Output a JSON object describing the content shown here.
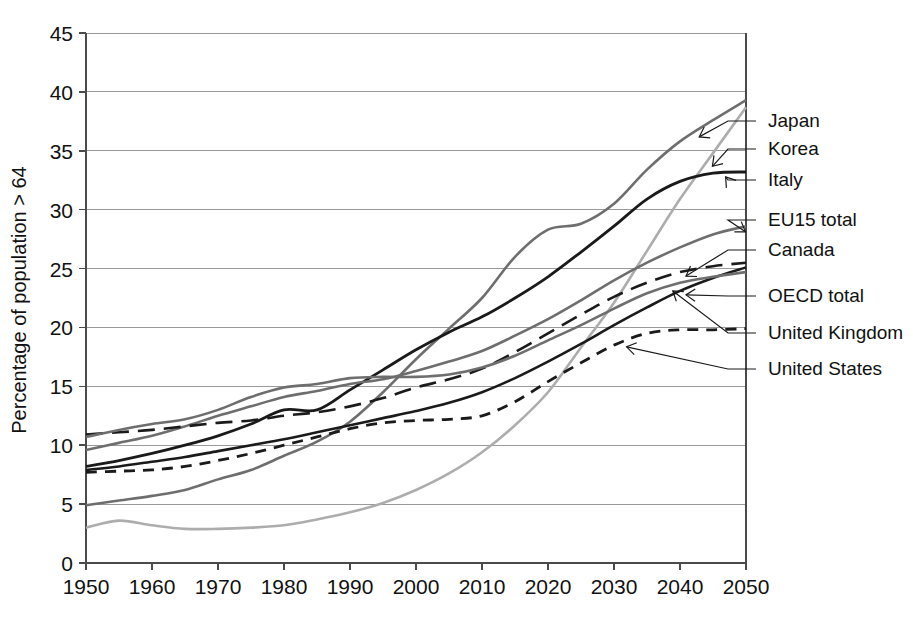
{
  "chart_data": {
    "type": "line",
    "title": "",
    "subtitle": "",
    "xlabel": "",
    "ylabel": "Percentage of population > 64",
    "xlim": [
      1950,
      2050
    ],
    "ylim": [
      0,
      45
    ],
    "ytick_step": 5,
    "xtick_step": 10,
    "grid": "horizontal",
    "legend_position": "right-inline-labels",
    "xticks": [
      "1950",
      "1960",
      "1970",
      "1980",
      "1990",
      "2000",
      "2010",
      "2020",
      "2030",
      "2040",
      "2050"
    ],
    "yticks": [
      "0",
      "5",
      "10",
      "15",
      "20",
      "25",
      "30",
      "35",
      "40",
      "45"
    ],
    "x": [
      1950,
      1955,
      1960,
      1965,
      1970,
      1975,
      1980,
      1985,
      1990,
      1995,
      2000,
      2005,
      2010,
      2015,
      2020,
      2025,
      2030,
      2035,
      2040,
      2045,
      2050
    ],
    "series": [
      {
        "name": "Japan",
        "label": "Japan",
        "color": "#6e6e6e",
        "style": "solid",
        "width": 2.6,
        "values": [
          4.9,
          5.3,
          5.7,
          6.2,
          7.1,
          7.9,
          9.1,
          10.3,
          12.0,
          14.5,
          17.3,
          19.9,
          22.5,
          26.0,
          28.3,
          28.8,
          30.5,
          33.4,
          35.8,
          37.6,
          39.3
        ]
      },
      {
        "name": "Korea",
        "label": "Korea",
        "color": "#adadad",
        "style": "solid",
        "width": 2.6,
        "values": [
          3.0,
          3.6,
          3.2,
          2.9,
          2.9,
          3.0,
          3.2,
          3.7,
          4.3,
          5.1,
          6.2,
          7.6,
          9.4,
          11.7,
          14.5,
          18.3,
          22.1,
          26.5,
          30.9,
          34.8,
          38.7
        ]
      },
      {
        "name": "Italy",
        "label": "Italy",
        "color": "#1a1a1a",
        "style": "solid",
        "width": 2.8,
        "values": [
          8.2,
          8.7,
          9.3,
          10.0,
          10.8,
          11.8,
          13.0,
          13.0,
          14.7,
          16.4,
          18.1,
          19.6,
          20.9,
          22.5,
          24.3,
          26.4,
          28.6,
          30.9,
          32.4,
          33.1,
          33.2
        ]
      },
      {
        "name": "EU15 total",
        "label": "EU15 total",
        "color": "#6e6e6e",
        "style": "solid",
        "width": 2.6,
        "values": [
          9.6,
          10.2,
          10.8,
          11.6,
          12.5,
          13.3,
          14.1,
          14.6,
          15.2,
          15.6,
          16.3,
          17.1,
          18.0,
          19.3,
          20.7,
          22.3,
          24.0,
          25.5,
          26.8,
          27.9,
          28.6
        ]
      },
      {
        "name": "Canada",
        "label": "Canada",
        "color": "#1a1a1a",
        "style": "dashed-long",
        "width": 2.6,
        "values": [
          10.9,
          11.1,
          11.3,
          11.6,
          11.9,
          12.1,
          12.5,
          12.8,
          13.3,
          14.0,
          14.9,
          15.6,
          16.5,
          17.9,
          19.5,
          21.1,
          22.6,
          23.8,
          24.7,
          25.2,
          25.5
        ]
      },
      {
        "name": "OECD total",
        "label": "OECD total",
        "color": "#1a1a1a",
        "style": "solid",
        "width": 2.6,
        "values": [
          7.9,
          8.2,
          8.6,
          9.0,
          9.5,
          10.0,
          10.5,
          11.1,
          11.7,
          12.3,
          12.9,
          13.6,
          14.5,
          15.7,
          17.1,
          18.6,
          20.2,
          21.7,
          23.1,
          24.2,
          25.1
        ]
      },
      {
        "name": "United Kingdom",
        "label": "United Kingdom",
        "color": "#6e6e6e",
        "style": "solid",
        "width": 2.6,
        "values": [
          10.7,
          11.3,
          11.8,
          12.2,
          13.0,
          14.1,
          14.9,
          15.2,
          15.7,
          15.8,
          15.8,
          16.0,
          16.6,
          17.6,
          18.9,
          20.2,
          21.6,
          22.9,
          23.8,
          24.3,
          24.7
        ]
      },
      {
        "name": "United States",
        "label": "United States",
        "color": "#1a1a1a",
        "style": "dashed-short",
        "width": 2.8,
        "values": [
          7.7,
          7.8,
          7.9,
          8.2,
          8.7,
          9.3,
          10.0,
          10.7,
          11.4,
          11.9,
          12.1,
          12.2,
          12.5,
          13.7,
          15.4,
          17.0,
          18.5,
          19.5,
          19.8,
          19.8,
          19.9
        ]
      }
    ],
    "annotations": [
      {
        "label": "Japan",
        "series": "Japan"
      },
      {
        "label": "Korea",
        "series": "Korea"
      },
      {
        "label": "Italy",
        "series": "Italy"
      },
      {
        "label": "EU15 total",
        "series": "EU15 total"
      },
      {
        "label": "Canada",
        "series": "Canada"
      },
      {
        "label": "OECD total",
        "series": "OECD total"
      },
      {
        "label": "United Kingdom",
        "series": "United Kingdom"
      },
      {
        "label": "United States",
        "series": "United States"
      }
    ]
  },
  "legend": {
    "items": [
      {
        "label": "Japan"
      },
      {
        "label": "Korea"
      },
      {
        "label": "Italy"
      },
      {
        "label": "EU15 total"
      },
      {
        "label": "Canada"
      },
      {
        "label": "OECD total"
      },
      {
        "label": "United Kingdom"
      },
      {
        "label": "United States"
      }
    ]
  },
  "axes": {
    "ylabel": "Percentage of population > 64"
  }
}
